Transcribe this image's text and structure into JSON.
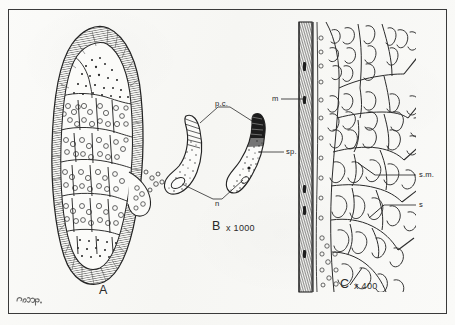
{
  "plate": {
    "background_color": "#f8f8f6",
    "frame_color": "#3a3a3a",
    "ink_color": "#1e1e1e"
  },
  "figures": [
    {
      "id": "A",
      "letter": "A",
      "magnification": "",
      "caption_letter": "A",
      "subject": "sarcocyst / encysted parasite, longitudinal section showing striated wall and internal compartments packed with spores, ruptured at lower right with escaping spores"
    },
    {
      "id": "B",
      "letter": "B",
      "magnification": "x 1000",
      "caption_letter": "B",
      "subject": "two crescent-shaped spores (banana-shaped merozoites), one outlined and one stippled"
    },
    {
      "id": "C",
      "letter": "C",
      "magnification": "x 400",
      "caption_letter": "C",
      "subject": "transverse section of gut wall showing muscular layer, submucosa and serosa with villous tissue"
    }
  ],
  "leader_labels": {
    "figure_b": [
      {
        "key": "pc",
        "text": "p.c.",
        "meaning": "polar capsule"
      },
      {
        "key": "sp",
        "text": "sp.",
        "meaning": "spore body"
      },
      {
        "key": "n",
        "text": "n",
        "meaning": "nucleus"
      }
    ],
    "figure_c": [
      {
        "key": "m",
        "text": "m",
        "meaning": "muscularis"
      },
      {
        "key": "sm",
        "text": "s.m.",
        "meaning": "submucosa"
      },
      {
        "key": "s",
        "text": "s",
        "meaning": "serosa"
      }
    ]
  },
  "signature": {
    "present": true,
    "text": "",
    "description": "artist monogram, illegible, lower-left corner"
  }
}
